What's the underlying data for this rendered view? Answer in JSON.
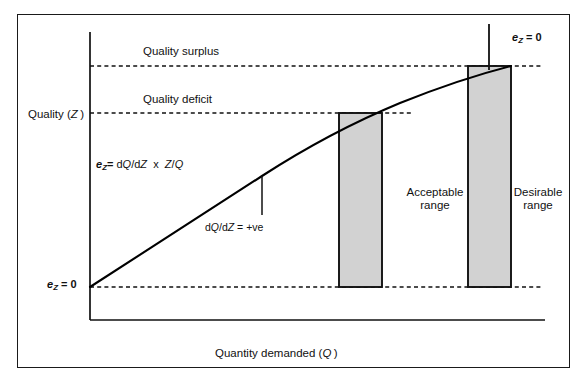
{
  "figure": {
    "type": "diagram",
    "background_color": "#ffffff",
    "border_color": "#1a1a1a",
    "bar_fill_color": "#d0d0d0",
    "line_color": "#000000"
  },
  "axes": {
    "y_label": "Quality (Z)",
    "y_label_plain": "Quality",
    "y_label_symbol": "Z",
    "x_label": "Quantity demanded (Q)",
    "x_label_plain": "Quantity demanded",
    "x_label_symbol": "Q"
  },
  "reference_lines": [
    {
      "name": "quality-surplus-line",
      "label": "Quality surplus",
      "y_px": 66,
      "style": "dashed"
    },
    {
      "name": "quality-deficit-line",
      "label": "Quality deficit",
      "y_px": 113,
      "style": "dashed"
    },
    {
      "name": "baseline-zero-line",
      "label": "",
      "y_px": 287,
      "style": "dashed"
    }
  ],
  "annotations": {
    "elasticity_formula": {
      "symbol": "e",
      "subscript": "Z",
      "equals": "=",
      "numerator": "dQ/dZ",
      "times": "x",
      "ratio": "Z/Q",
      "full_text": "eZ = dQ/dZ x Z/Q"
    },
    "slope_label": {
      "text": "dQ/dZ = +ve",
      "derivative": "dQ/dZ",
      "value": "+ve"
    },
    "ez_zero_left": {
      "symbol": "e",
      "subscript": "Z",
      "value": "0",
      "full_text": "eZ = 0"
    },
    "ez_zero_top": {
      "symbol": "e",
      "subscript": "Z",
      "value": "0",
      "full_text": "eZ = 0"
    }
  },
  "bars": [
    {
      "name": "acceptable-range-bar",
      "label_line1": "Acceptable",
      "label_line2": "range",
      "x_px": 339,
      "width_px": 43,
      "top_px": 113,
      "bottom_px": 287
    },
    {
      "name": "desirable-range-bar",
      "label_line1": "Desirable",
      "label_line2": "range",
      "x_px": 468,
      "width_px": 43,
      "top_px": 66,
      "bottom_px": 287
    }
  ],
  "curve": {
    "name": "quality-demand-curve",
    "description": "concave increasing curve from origin on y-axis to top-right",
    "start": {
      "x_px": 90,
      "y_px": 287
    },
    "end": {
      "x_px": 511,
      "y_px": 66
    }
  }
}
